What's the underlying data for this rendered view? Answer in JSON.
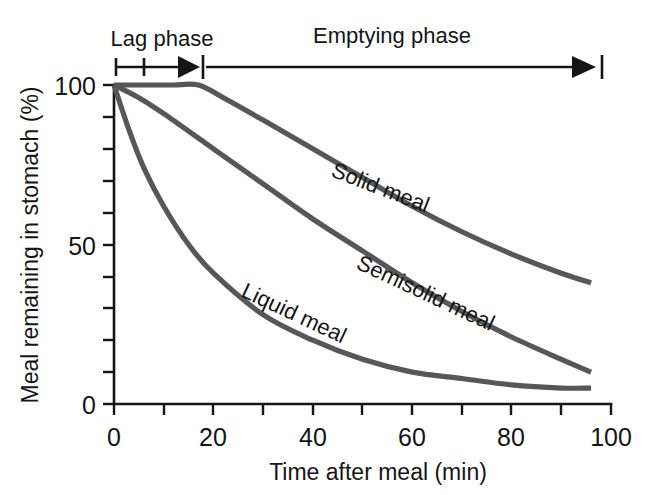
{
  "figure": {
    "background_color": "#ffffff",
    "axis_color": "#151515",
    "curve_color": "#575757"
  },
  "chart_data": {
    "type": "line",
    "title": "",
    "xlabel": "Time after meal (min)",
    "ylabel": "Meal remaining in stomach (%)",
    "xlim": [
      0,
      100
    ],
    "ylim": [
      0,
      100
    ],
    "xticks": [
      0,
      10,
      20,
      30,
      40,
      50,
      60,
      70,
      80,
      90,
      100
    ],
    "xtick_labels": [
      "0",
      "",
      "20",
      "",
      "40",
      "",
      "60",
      "",
      "80",
      "",
      "100"
    ],
    "yticks": [
      0,
      10,
      20,
      30,
      40,
      50,
      60,
      70,
      80,
      90,
      100
    ],
    "ytick_labels": [
      "0",
      "",
      "",
      "",
      "",
      "50",
      "",
      "",
      "",
      "",
      "100"
    ],
    "grid": false,
    "legend": "inline-curve-labels",
    "annotations": [
      {
        "name": "lag-phase",
        "text": "Lag phase",
        "x_start": 0,
        "x_end": 17
      },
      {
        "name": "emptying-phase",
        "text": "Emptying phase",
        "x_start": 17,
        "x_end": 99
      }
    ],
    "series": [
      {
        "name": "Solid meal",
        "label": "Solid meal",
        "x": [
          0,
          4,
          8,
          12,
          17,
          22,
          30,
          40,
          50,
          60,
          70,
          80,
          90,
          96
        ],
        "values": [
          100,
          100,
          100,
          100,
          100,
          96,
          89,
          80,
          71,
          62,
          54,
          47,
          41,
          38
        ]
      },
      {
        "name": "Semisolid meal",
        "label": "Semisolid meal",
        "x": [
          0,
          5,
          10,
          20,
          30,
          40,
          50,
          60,
          70,
          80,
          90,
          96
        ],
        "values": [
          100,
          96,
          91,
          80,
          69,
          58,
          48,
          38,
          29,
          21,
          14,
          10
        ]
      },
      {
        "name": "Liquid meal",
        "label": "Liquid meal",
        "x": [
          0,
          3,
          6,
          10,
          15,
          20,
          30,
          40,
          50,
          60,
          70,
          80,
          90,
          96
        ],
        "values": [
          100,
          86,
          74,
          62,
          50,
          41,
          28,
          20,
          14,
          10,
          8,
          6,
          5,
          5
        ]
      }
    ]
  }
}
